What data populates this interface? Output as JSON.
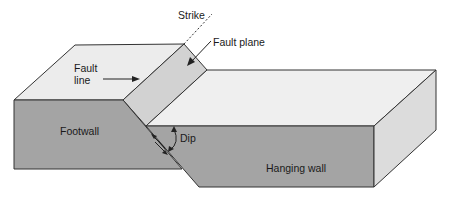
{
  "diagram": {
    "labels": {
      "strike": "Strike",
      "fault_plane": "Fault plane",
      "fault_line_1": "Fault",
      "fault_line_2": "line",
      "footwall": "Footwall",
      "dip": "Dip",
      "hanging_wall": "Hanging wall"
    },
    "colors": {
      "top_surface": "#ededed",
      "fault_plane": "#d4d4d4",
      "front_face": "#a3a3a3",
      "side_face": "#dedede",
      "outline": "#333333"
    }
  }
}
